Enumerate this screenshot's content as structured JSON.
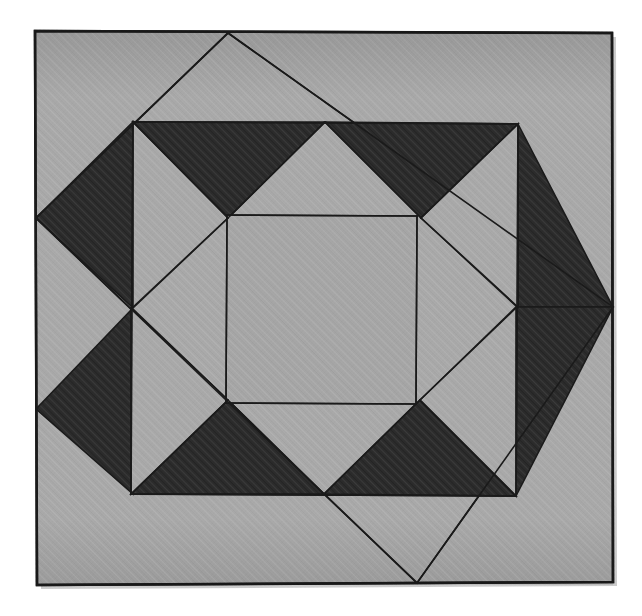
{
  "artwork": {
    "title": "Geometric Quilt Block",
    "kind": "quilt-block-pattern",
    "canvas": {
      "width": 642,
      "height": 616,
      "background": "#ffffff"
    },
    "palette": {
      "background": "#ffffff",
      "light_gray": "#a9a9a9",
      "mid_gray": "#a3a3a3",
      "center_gray": "#a6a6a6",
      "dark": "#2c2c2c",
      "outline": "#1a1a1a",
      "shadow": "#8d8d8d"
    },
    "stroke_width": 1.6
  },
  "geometry": {
    "outer_frame": {
      "name": "outer-square-frame",
      "points": "35,31 612,33 613,582 37,585",
      "fill": "#a9a9a9"
    },
    "diamond": {
      "name": "large-diamond",
      "points": "228,33 613,307 417,583 36,218",
      "fill": "#a9a9a9",
      "vertices": {
        "top": "228,33",
        "right": "613,307",
        "bottom": "417,583",
        "left": "36,218"
      }
    },
    "inner_frame": {
      "name": "inner-square-frame",
      "points": "133,122 518,124 516,496 131,494",
      "fill": "#a9a9a9"
    },
    "center_square": {
      "name": "center-square",
      "points": "227,215 417,216 416,404 226,403",
      "fill": "#a6a6a6"
    },
    "dark_triangles": [
      {
        "name": "dark-triangle-top-left-outer",
        "points": "133,122 325,122 228,218"
      },
      {
        "name": "dark-triangle-top-right-outer",
        "points": "325,122 518,124 421,218"
      },
      {
        "name": "dark-triangle-left-upper",
        "points": "36,218 133,122 133,308"
      },
      {
        "name": "dark-triangle-left-lower",
        "points": "36,409 133,308 133,494"
      },
      {
        "name": "dark-triangle-right-upper",
        "points": "518,124 613,307 518,307"
      },
      {
        "name": "dark-triangle-right-lower",
        "points": "516,307 613,307 516,496"
      },
      {
        "name": "dark-triangle-bottom-left-outer",
        "points": "131,494 324,494 228,400"
      },
      {
        "name": "dark-triangle-bottom-right-outer",
        "points": "324,494 516,496 420,400"
      }
    ],
    "light_triangles": [
      {
        "name": "light-triangle-top-left-inner",
        "points": "133,122 228,218 133,308"
      },
      {
        "name": "light-triangle-top-right-inner",
        "points": "518,124 518,307 421,218"
      },
      {
        "name": "light-triangle-bottom-left-inner",
        "points": "131,494 228,400 133,308"
      },
      {
        "name": "light-triangle-bottom-right-inner",
        "points": "516,496 516,307 420,400"
      },
      {
        "name": "light-triangle-north-point",
        "points": "133,122 228,33 325,122"
      },
      {
        "name": "light-triangle-west-point",
        "points": "36,218 133,122 133,308"
      },
      {
        "name": "light-triangle-east-point",
        "points": "613,307 518,124 518,496"
      },
      {
        "name": "light-triangle-south-point",
        "points": "131,494 417,583 516,496"
      }
    ],
    "guide_lines": [
      {
        "name": "diagonal-nw",
        "from": "36,218",
        "to": "228,33"
      },
      {
        "name": "diagonal-ne",
        "from": "228,33",
        "to": "613,307"
      },
      {
        "name": "diagonal-se",
        "from": "613,307",
        "to": "417,583"
      },
      {
        "name": "diagonal-sw",
        "from": "417,583",
        "to": "36,218"
      },
      {
        "name": "inner-frame-top",
        "from": "133,122",
        "to": "518,124"
      },
      {
        "name": "inner-frame-right",
        "from": "518,124",
        "to": "516,496"
      },
      {
        "name": "inner-frame-bottom",
        "from": "516,496",
        "to": "131,494"
      },
      {
        "name": "inner-frame-left",
        "from": "131,494",
        "to": "133,122"
      },
      {
        "name": "center-square-top",
        "from": "227,215",
        "to": "417,216"
      },
      {
        "name": "center-square-right",
        "from": "417,216",
        "to": "416,404"
      },
      {
        "name": "center-square-bottom",
        "from": "416,404",
        "to": "226,403"
      },
      {
        "name": "center-square-left",
        "from": "226,403",
        "to": "227,215"
      }
    ]
  }
}
